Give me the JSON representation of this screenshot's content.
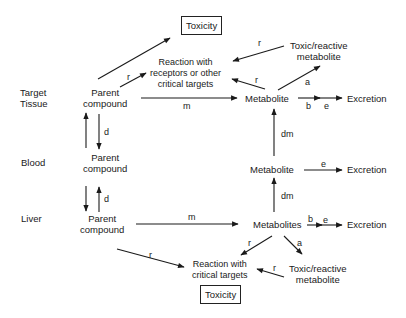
{
  "rows": {
    "target_tissue": "Target\nTissue",
    "target_line1": "Target",
    "target_line2": "Tissue",
    "blood": "Blood",
    "liver": "Liver"
  },
  "nodes": {
    "parent_target": [
      "Parent",
      "compound"
    ],
    "parent_blood": [
      "Parent",
      "compound"
    ],
    "parent_liver": [
      "Parent",
      "compound"
    ],
    "reaction_target": [
      "Reaction with",
      "receptors or other",
      "critical targets"
    ],
    "toxicity_top": "Toxicity",
    "toxic_reactive_top": [
      "Toxic/reactive",
      "metabolite"
    ],
    "metabolite_target": "Metabolite",
    "excretion_target": "Excretion",
    "metabolite_blood": "Metabolite",
    "excretion_blood": "Excretion",
    "metabolites_liver": "Metabolites",
    "excretion_liver": "Excretion",
    "reaction_liver": [
      "Reaction with",
      "critical targets"
    ],
    "toxic_reactive_liver": [
      "Toxic/reactive",
      "metabolite"
    ],
    "toxicity_bottom": "Toxicity"
  },
  "edge_labels": {
    "r": "r",
    "m": "m",
    "d": "d",
    "a": "a",
    "b": "b",
    "e": "e",
    "dm": "dm"
  },
  "colors": {
    "line": "#1a1a1a",
    "background": "#ffffff"
  }
}
